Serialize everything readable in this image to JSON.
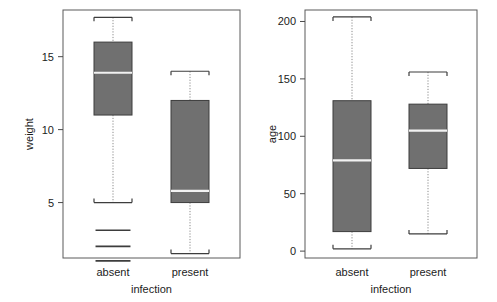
{
  "figure": {
    "title": "",
    "width": 497,
    "height": 302,
    "background": "#ffffff",
    "box_fill": "#707070",
    "box_stroke": "#3d3d3d",
    "median_color": "#f2f2f2",
    "whisker_color": "#8a8a8a",
    "frame_color": "#5a5a5a"
  },
  "chart_data": [
    {
      "type": "boxplot",
      "panel": "left",
      "title": "",
      "xlabel": "infection",
      "ylabel": "weight",
      "categories": [
        "absent",
        "present"
      ],
      "ylim": [
        1.2,
        18.2
      ],
      "yticks": [
        5,
        10,
        15
      ],
      "ytick_labels": [
        "5",
        "10",
        "15"
      ],
      "grid": false,
      "legend": "none",
      "boxes": [
        {
          "category": "absent",
          "whisker_low": 5.0,
          "q1": 11.0,
          "median": 13.9,
          "q3": 16.0,
          "whisker_high": 17.7,
          "outliers": [
            3.1,
            2.0,
            1.0
          ]
        },
        {
          "category": "present",
          "whisker_low": 1.5,
          "q1": 5.0,
          "median": 5.8,
          "q3": 12.0,
          "whisker_high": 14.0,
          "outliers": []
        }
      ]
    },
    {
      "type": "boxplot",
      "panel": "right",
      "title": "",
      "xlabel": "infection",
      "ylabel": "age",
      "categories": [
        "absent",
        "present"
      ],
      "ylim": [
        -6,
        210
      ],
      "yticks": [
        0,
        50,
        100,
        150,
        200
      ],
      "ytick_labels": [
        "0",
        "50",
        "100",
        "150",
        "200"
      ],
      "grid": false,
      "legend": "none",
      "boxes": [
        {
          "category": "absent",
          "whisker_low": 2,
          "q1": 17,
          "median": 79,
          "q3": 131,
          "whisker_high": 204,
          "outliers": []
        },
        {
          "category": "present",
          "whisker_low": 15,
          "q1": 72,
          "median": 105,
          "q3": 128,
          "whisker_high": 156,
          "outliers": []
        }
      ]
    }
  ]
}
